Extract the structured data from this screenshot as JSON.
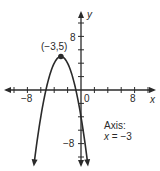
{
  "chart_data": {
    "type": "line",
    "title": "",
    "equation": "y = -(x + 3)^2 + 5",
    "xlabel": "x",
    "ylabel": "y",
    "xlim": [
      -12,
      12
    ],
    "ylim": [
      -11,
      12
    ],
    "x_tick_step": 2,
    "y_tick_step": 2,
    "x_tick_labels": [
      "-8",
      "0",
      "8"
    ],
    "y_tick_labels": [
      "8",
      "-8"
    ],
    "grid": false,
    "vertex": {
      "x": -3,
      "y": 5,
      "label": "(−3,5)"
    },
    "x_intercepts": [
      -5.24,
      -0.76
    ],
    "y_intercept": -4,
    "axis_of_symmetry": "x = -3",
    "annotations": [
      "(−3,5)",
      "Axis:",
      "x = −3"
    ],
    "series": [
      {
        "name": "parabola",
        "x": [
          -7,
          -6,
          -5,
          -4,
          -3,
          -2,
          -1,
          0,
          1
        ],
        "y": [
          -11,
          -4,
          1,
          4,
          5,
          4,
          1,
          -4,
          -11
        ]
      }
    ]
  },
  "labels": {
    "x_axis": "x",
    "y_axis": "y",
    "x_neg8": "−8",
    "x_zero": "0",
    "x_pos8": "8",
    "y_pos8": "8",
    "y_neg8": "−8",
    "vertex": "(−3,5)",
    "axis_title": "Axis:",
    "axis_eq_var": "x",
    "axis_eq_rest": " = −3"
  },
  "colors": {
    "ink": "#2a2a2a",
    "background": "#ffffff"
  }
}
